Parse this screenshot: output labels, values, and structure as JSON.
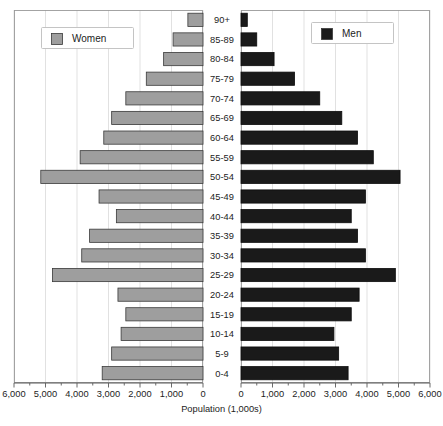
{
  "chart_data": {
    "type": "bar",
    "subtype": "population-pyramid",
    "title": "",
    "xlabel": "Population (1,000s)",
    "ylabel": "",
    "grid": true,
    "legend_position": "inside-top-left-and-top-right",
    "categories": [
      "0-4",
      "5-9",
      "10-14",
      "15-19",
      "20-24",
      "25-29",
      "30-34",
      "35-39",
      "40-44",
      "45-49",
      "50-54",
      "55-59",
      "60-64",
      "65-69",
      "70-74",
      "75-79",
      "80-84",
      "85-89",
      "90+"
    ],
    "axis": {
      "left_ticks": [
        "6,000",
        "5,000",
        "4,000",
        "3,000",
        "2,000",
        "1,000",
        "0"
      ],
      "right_ticks": [
        "0",
        "1,000",
        "2,000",
        "3,000",
        "4,000",
        "5,000",
        "6,000"
      ],
      "left_tick_values": [
        6000,
        5000,
        4000,
        3000,
        2000,
        1000,
        0
      ],
      "right_tick_values": [
        0,
        1000,
        2000,
        3000,
        4000,
        5000,
        6000
      ],
      "xlim": [
        0,
        6000
      ],
      "units": "thousands"
    },
    "series": [
      {
        "name": "Women",
        "side": "left",
        "color": "#9e9e9e",
        "values": [
          3200,
          2900,
          2600,
          2450,
          2700,
          4780,
          3850,
          3600,
          2750,
          3300,
          5150,
          3900,
          3150,
          2900,
          2450,
          1800,
          1250,
          950,
          480
        ]
      },
      {
        "name": "Men",
        "side": "right",
        "color": "#1a1a1a",
        "values": [
          3400,
          3100,
          2950,
          3500,
          3750,
          4900,
          3950,
          3700,
          3500,
          3950,
          5050,
          4200,
          3700,
          3200,
          2500,
          1700,
          1050,
          500,
          200
        ]
      }
    ]
  },
  "legend": {
    "women": {
      "label": "Women",
      "swatch_color": "#9e9e9e"
    },
    "men": {
      "label": "Men",
      "swatch_color": "#1a1a1a"
    }
  },
  "axis_label": "Population (1,000s)"
}
